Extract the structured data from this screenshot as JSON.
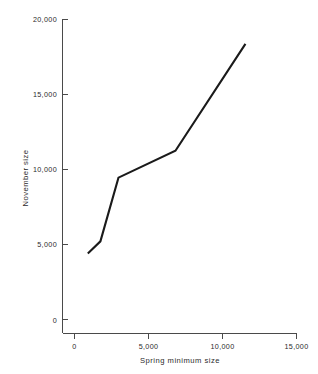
{
  "chart_data": {
    "type": "line",
    "title": "",
    "xlabel": "Spring minimum size",
    "ylabel": "November size",
    "xlim": [
      0,
      15000
    ],
    "ylim": [
      0,
      20000
    ],
    "grid": false,
    "legend": null,
    "xticks": [
      0,
      5000,
      10000,
      15000
    ],
    "yticks": [
      0,
      5000,
      10000,
      15000,
      20000
    ],
    "xtick_labels": [
      "0",
      "5,000",
      "10,000",
      "15,000"
    ],
    "ytick_labels": [
      "0",
      "5,000",
      "10,000",
      "15,000",
      "20,000"
    ],
    "series": [
      {
        "name": "November size vs spring minimum size",
        "x": [
          900,
          1750,
          2970,
          6820,
          11550
        ],
        "y": [
          4400,
          5200,
          9440,
          11230,
          18340
        ]
      }
    ]
  },
  "axes": {
    "x_title": "Spring minimum size",
    "y_title": "November size",
    "x_tick_0": "0",
    "x_tick_1": "5,000",
    "x_tick_2": "10,000",
    "x_tick_3": "15,000",
    "y_tick_0": "0",
    "y_tick_1": "5,000",
    "y_tick_2": "10,000",
    "y_tick_3": "15,000",
    "y_tick_4": "20,000"
  },
  "colors": {
    "line": "#1a1a1a",
    "axis": "#4a4a4a",
    "text": "#2b2b2b",
    "background": "#ffffff"
  }
}
